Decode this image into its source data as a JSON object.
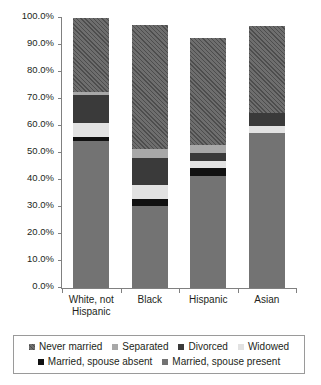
{
  "chart_data": {
    "type": "bar",
    "subtype": "stacked-bar-percent",
    "title": "",
    "xlabel": "",
    "ylabel": "",
    "ylim": [
      0,
      100
    ],
    "grid": false,
    "legend_position": "bottom",
    "categories": [
      "White, not Hispanic",
      "Black",
      "Hispanic",
      "Asian"
    ],
    "category_labels": [
      {
        "line1": "White, not",
        "line2": "Hispanic"
      },
      {
        "line1": "Black",
        "line2": ""
      },
      {
        "line1": "Hispanic",
        "line2": ""
      },
      {
        "line1": "Asian",
        "line2": ""
      }
    ],
    "y_ticks": [
      "0.0%",
      "10.0%",
      "20.0%",
      "30.0%",
      "40.0%",
      "50.0%",
      "60.0%",
      "70.0%",
      "80.0%",
      "90.0%",
      "100.0%"
    ],
    "y_tick_values": [
      0,
      10,
      20,
      30,
      40,
      50,
      60,
      70,
      80,
      90,
      100
    ],
    "stack_order_bottom_to_top": [
      "Married, spouse present",
      "Married, spouse absent",
      "Widowed",
      "Divorced",
      "Separated",
      "Never married"
    ],
    "series": [
      {
        "name": "Married, spouse present",
        "color": "#737373",
        "pattern": "solid",
        "values": [
          54.5,
          30.5,
          41.5,
          57.5
        ]
      },
      {
        "name": "Married, spouse absent",
        "color": "#111111",
        "pattern": "solid",
        "values": [
          1.5,
          2.5,
          3.0,
          0.0
        ]
      },
      {
        "name": "Widowed",
        "color": "#e2e2e2",
        "pattern": "solid",
        "values": [
          5.0,
          5.0,
          2.5,
          2.5
        ]
      },
      {
        "name": "Divorced",
        "color": "#3a3a3a",
        "pattern": "solid",
        "values": [
          10.5,
          10.0,
          3.0,
          5.0
        ]
      },
      {
        "name": "Separated",
        "color": "#a8a8a8",
        "pattern": "solid",
        "values": [
          1.0,
          3.5,
          3.0,
          0.0
        ]
      },
      {
        "name": "Never married",
        "color": "#6e6e6e",
        "pattern": "diagonal-hatch",
        "values": [
          27.5,
          46.0,
          39.5,
          32.0
        ]
      }
    ],
    "bar_totals": [
      100.0,
      97.5,
      92.5,
      97.0
    ]
  },
  "legend": {
    "rows": [
      [
        {
          "label": "Never married",
          "swatch": "never-married-swatch"
        },
        {
          "label": "Separated",
          "swatch": "separated-swatch"
        },
        {
          "label": "Divorced",
          "swatch": "divorced-swatch"
        },
        {
          "label": "Widowed",
          "swatch": "widowed-swatch"
        }
      ],
      [
        {
          "label": "Married, spouse absent",
          "swatch": "married-absent-swatch"
        },
        {
          "label": "Married, spouse present",
          "swatch": "married-present-swatch"
        }
      ]
    ]
  }
}
